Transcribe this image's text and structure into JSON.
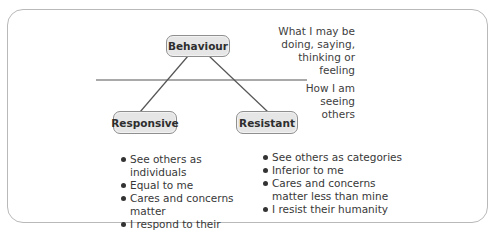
{
  "diagram": {
    "nodes": {
      "top": "Behaviour",
      "left": "Responsive",
      "right": "Resistant"
    },
    "annotations": {
      "above_line": [
        "What I may be",
        "doing, saying,",
        "thinking or",
        "feeling"
      ],
      "below_line": [
        "How I am",
        "seeing",
        "others"
      ]
    },
    "responsive_list": [
      "See others as individuals",
      "Equal to me",
      "Cares and concerns matter",
      "I respond to their humanity"
    ],
    "resistant_list": [
      "See others as categories",
      "Inferior to me",
      "Cares and concerns matter less than mine",
      "I resist their humanity"
    ],
    "colors": {
      "node_fill": "#e6e6e6",
      "node_border": "#8f8f8f",
      "line": "#555555",
      "frame": "#b9b9b9"
    }
  }
}
